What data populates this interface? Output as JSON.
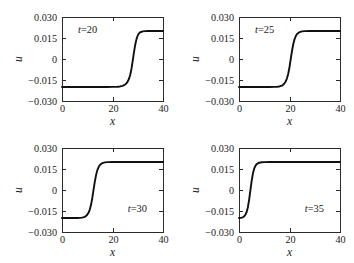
{
  "figure": {
    "panel_count": 4,
    "layout": "2x2 grid"
  },
  "chart_data": [
    {
      "type": "line",
      "title": "",
      "annotation": "t=20",
      "annotation_var": "t",
      "annotation_value": "=20",
      "annotation_position": "top-left",
      "xlabel": "x",
      "ylabel": "u",
      "xlim": [
        0,
        40
      ],
      "ylim": [
        -0.03,
        0.03
      ],
      "xticks": [
        0,
        20,
        40
      ],
      "xticklabels": [
        "0",
        "20",
        "40"
      ],
      "yticks": [
        -0.03,
        -0.015,
        0,
        0.015,
        0.03
      ],
      "yticklabels": [
        "-0.030",
        "-0.015",
        "0",
        "0.015",
        "0.030"
      ],
      "grid": false,
      "legend": "none",
      "series": [
        {
          "name": "u(x, t=20)",
          "form": "kink (tanh front)",
          "lower_plateau": -0.02,
          "upper_plateau": 0.02,
          "front_center_x": 28.0,
          "front_width_x": 2.1,
          "color": "#101010",
          "x": [
            0,
            2,
            4,
            6,
            8,
            10,
            12,
            14,
            16,
            18,
            20,
            21,
            22,
            23,
            24,
            25,
            25.5,
            26,
            26.5,
            27,
            27.5,
            28,
            28.5,
            29,
            29.5,
            30,
            30.5,
            31,
            32,
            33,
            34,
            36,
            38,
            40
          ],
          "y": [
            -0.02,
            -0.02,
            -0.02,
            -0.02,
            -0.02,
            -0.02,
            -0.02,
            -0.02,
            -0.02,
            -0.02,
            -0.0199,
            -0.0199,
            -0.0198,
            -0.0196,
            -0.0192,
            -0.0182,
            -0.0174,
            -0.0162,
            -0.0143,
            -0.0114,
            -0.0071,
            -0.0014,
            0.0047,
            0.0102,
            0.0142,
            0.0168,
            0.0183,
            0.0191,
            0.0197,
            0.0199,
            0.02,
            0.02,
            0.02,
            0.02
          ]
        }
      ]
    },
    {
      "type": "line",
      "title": "",
      "annotation": "t=25",
      "annotation_var": "t",
      "annotation_value": "=25",
      "annotation_position": "top-left",
      "xlabel": "x",
      "ylabel": "u",
      "xlim": [
        0,
        40
      ],
      "ylim": [
        -0.03,
        0.03
      ],
      "xticks": [
        0,
        20,
        40
      ],
      "xticklabels": [
        "0",
        "20",
        "40"
      ],
      "yticks": [
        -0.03,
        -0.015,
        0,
        0.015,
        0.03
      ],
      "yticklabels": [
        "-0.030",
        "-0.015",
        "0",
        "0.015",
        "0.030"
      ],
      "grid": false,
      "legend": "none",
      "series": [
        {
          "name": "u(x, t=25)",
          "form": "kink (tanh front)",
          "lower_plateau": -0.02,
          "upper_plateau": 0.02,
          "front_center_x": 20.0,
          "front_width_x": 2.1,
          "color": "#101010",
          "x": [
            0,
            2,
            4,
            6,
            8,
            10,
            12,
            14,
            15,
            16,
            17,
            17.5,
            18,
            18.5,
            19,
            19.5,
            20,
            20.5,
            21,
            21.5,
            22,
            22.5,
            23,
            24,
            25,
            26,
            28,
            30,
            32,
            34,
            36,
            38,
            40
          ],
          "y": [
            -0.02,
            -0.02,
            -0.02,
            -0.02,
            -0.02,
            -0.02,
            -0.02,
            -0.0199,
            -0.0198,
            -0.0196,
            -0.019,
            -0.0184,
            -0.0174,
            -0.016,
            -0.0138,
            -0.0105,
            -0.0057,
            0.0001,
            0.0059,
            0.0107,
            0.0141,
            0.0164,
            0.0178,
            0.0192,
            0.0197,
            0.0199,
            0.02,
            0.02,
            0.02,
            0.02,
            0.02,
            0.02,
            0.02
          ]
        }
      ]
    },
    {
      "type": "line",
      "title": "",
      "annotation": "t=30",
      "annotation_var": "t",
      "annotation_value": "=30",
      "annotation_position": "bottom-right",
      "xlabel": "x",
      "ylabel": "u",
      "xlim": [
        0,
        40
      ],
      "ylim": [
        -0.03,
        0.03
      ],
      "xticks": [
        0,
        20,
        40
      ],
      "xticklabels": [
        "0",
        "20",
        "40"
      ],
      "yticks": [
        -0.03,
        -0.015,
        0,
        0.015,
        0.03
      ],
      "yticklabels": [
        "-0.030",
        "-0.015",
        "0",
        "0.015",
        "0.030"
      ],
      "grid": false,
      "legend": "none",
      "series": [
        {
          "name": "u(x, t=30)",
          "form": "kink (tanh front)",
          "lower_plateau": -0.02,
          "upper_plateau": 0.02,
          "front_center_x": 12.0,
          "front_width_x": 2.0,
          "color": "#101010",
          "x": [
            0,
            1,
            2,
            3,
            4,
            5,
            6,
            7,
            8,
            9,
            9.5,
            10,
            10.5,
            11,
            11.5,
            12,
            12.5,
            13,
            13.5,
            14,
            14.5,
            15,
            16,
            17,
            18,
            20,
            24,
            28,
            32,
            36,
            40
          ],
          "y": [
            -0.02,
            -0.02,
            -0.02,
            -0.02,
            -0.02,
            -0.02,
            -0.02,
            -0.0199,
            -0.0197,
            -0.0192,
            -0.0186,
            -0.0177,
            -0.0163,
            -0.014,
            -0.0106,
            -0.0057,
            0.0002,
            0.006,
            0.0108,
            0.0142,
            0.0164,
            0.0178,
            0.0192,
            0.0197,
            0.0199,
            0.02,
            0.02,
            0.02,
            0.02,
            0.02,
            0.02
          ]
        }
      ]
    },
    {
      "type": "line",
      "title": "",
      "annotation": "t=35",
      "annotation_var": "t",
      "annotation_value": "=35",
      "annotation_position": "bottom-right",
      "xlabel": "x",
      "ylabel": "u",
      "xlim": [
        0,
        40
      ],
      "ylim": [
        -0.03,
        0.03
      ],
      "xticks": [
        0,
        20,
        40
      ],
      "xticklabels": [
        "0",
        "20",
        "40"
      ],
      "yticks": [
        -0.03,
        -0.015,
        0,
        0.015,
        0.03
      ],
      "yticklabels": [
        "-0.030",
        "-0.015",
        "0",
        "0.015",
        "0.030"
      ],
      "grid": false,
      "legend": "none",
      "series": [
        {
          "name": "u(x, t=35)",
          "form": "kink (tanh front)",
          "lower_plateau": -0.02,
          "upper_plateau": 0.02,
          "front_center_x": 4.0,
          "front_width_x": 1.9,
          "color": "#101010",
          "x": [
            0,
            0.5,
            1,
            1.5,
            2,
            2.5,
            3,
            3.5,
            4,
            4.5,
            5,
            5.5,
            6,
            6.5,
            7,
            8,
            9,
            10,
            12,
            16,
            20,
            24,
            28,
            32,
            36,
            40
          ],
          "y": [
            -0.02,
            -0.0199,
            -0.0198,
            -0.0195,
            -0.0189,
            -0.0178,
            -0.0159,
            -0.0125,
            -0.007,
            -0.0004,
            0.0063,
            0.0117,
            0.0152,
            0.0173,
            0.0185,
            0.0195,
            0.0198,
            0.0199,
            0.02,
            0.02,
            0.02,
            0.02,
            0.02,
            0.02,
            0.02,
            0.02
          ]
        }
      ]
    }
  ],
  "style": {
    "curve_color": "#101010",
    "axis_color": "#2b2b2b",
    "background": "#ffffff"
  }
}
